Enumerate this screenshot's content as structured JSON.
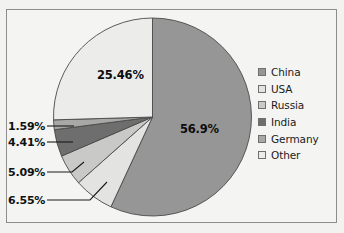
{
  "chart_data": {
    "type": "pie",
    "title": "",
    "categories": [
      "China",
      "USA",
      "Russia",
      "India",
      "Germany",
      "Other"
    ],
    "values": [
      56.9,
      6.55,
      5.09,
      4.41,
      1.59,
      25.46
    ],
    "value_labels": [
      "56.9%",
      "6.55%",
      "5.09%",
      "4.41%",
      "1.59%",
      "25.46%"
    ],
    "colors": [
      "#969696",
      "#e3e3e1",
      "#c9c9c7",
      "#6e6e6e",
      "#a8a8a6",
      "#ececeb"
    ],
    "unit": "%",
    "start_angle_deg": 0,
    "direction": "clockwise",
    "legend_position": "right",
    "grid": false,
    "inside_labels": [
      "56.9%",
      "25.46%"
    ],
    "callout_labels": [
      "1.59%",
      "4.41%",
      "5.09%",
      "6.55%"
    ]
  },
  "legend": {
    "items": [
      {
        "label": "China",
        "color": "#969696"
      },
      {
        "label": "USA",
        "color": "#e3e3e1"
      },
      {
        "label": "Russia",
        "color": "#c9c9c7"
      },
      {
        "label": "India",
        "color": "#6e6e6e"
      },
      {
        "label": "Germany",
        "color": "#a8a8a6"
      },
      {
        "label": "Other",
        "color": "#ececeb"
      }
    ]
  },
  "labels": {
    "china": "56.9%",
    "other": "25.46%",
    "germany": "1.59%",
    "india": "4.41%",
    "russia": "5.09%",
    "usa": "6.55%"
  },
  "style": {
    "frame_border": "#8d8d8d",
    "background": "#f2f2f0",
    "pie_outline": "#4a4a4a"
  }
}
